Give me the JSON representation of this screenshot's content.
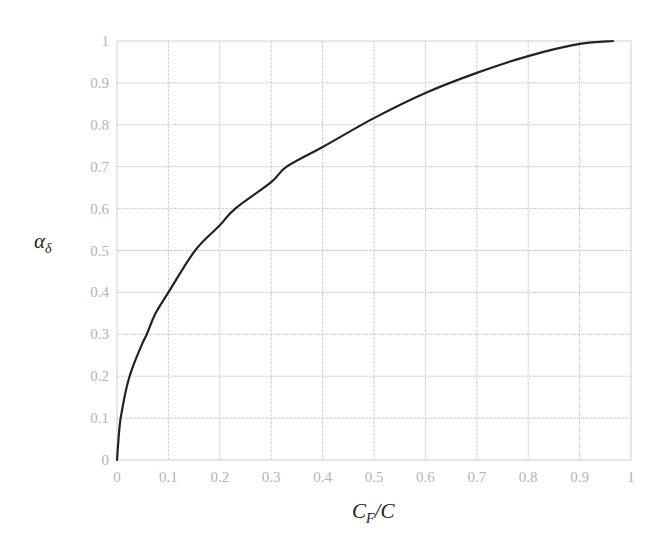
{
  "chart_data": {
    "type": "line",
    "title": "",
    "xlabel": "C_F/C",
    "ylabel": "α_δ",
    "xlabel_parts": {
      "main": "C",
      "sub": "F",
      "rest": "/C"
    },
    "ylabel_parts": {
      "main": "α",
      "sub": "δ"
    },
    "xlim": [
      0,
      1
    ],
    "ylim": [
      0,
      1
    ],
    "grid": true,
    "legend": null,
    "x_ticks": [
      "0",
      "0.1",
      "0.2",
      "0.3",
      "0.4",
      "0.5",
      "0.6",
      "0.7",
      "0.8",
      "0.9",
      "1"
    ],
    "y_ticks": [
      "0",
      "0.1",
      "0.2",
      "0.3",
      "0.4",
      "0.5",
      "0.6",
      "0.7",
      "0.8",
      "0.9",
      "1"
    ],
    "series": [
      {
        "name": "alpha_delta",
        "color": "#222222",
        "x": [
          0,
          0.005,
          0.01,
          0.02,
          0.03,
          0.05,
          0.058,
          0.075,
          0.1,
          0.152,
          0.2,
          0.23,
          0.3,
          0.33,
          0.4,
          0.5,
          0.6,
          0.7,
          0.8,
          0.9,
          0.965
        ],
        "y": [
          0,
          0.08,
          0.12,
          0.18,
          0.22,
          0.28,
          0.3,
          0.35,
          0.4,
          0.5,
          0.56,
          0.6,
          0.663,
          0.7,
          0.747,
          0.816,
          0.876,
          0.924,
          0.964,
          0.993,
          1.0
        ]
      }
    ]
  },
  "colors": {
    "grid": "#cfcfcf",
    "tick_label": "#b4b4b4",
    "curve": "#222222",
    "axis_label": "#222222"
  }
}
